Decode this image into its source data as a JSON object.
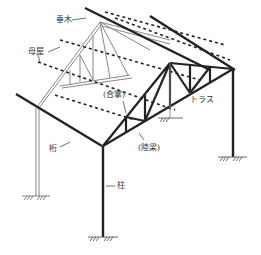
{
  "diagram": {
    "type": "isometric structural drawing",
    "colors": {
      "line_front": "#222222",
      "line_back": "#777777",
      "background": "#ffffff",
      "label_text": "#333333"
    }
  },
  "labels": {
    "rafter": "垂木",
    "purlin": "母屋",
    "principal_rafter": "(合掌)",
    "tie_beam": "(陸梁)",
    "truss": "トラス",
    "eave_beam": "桁",
    "column": "柱"
  }
}
